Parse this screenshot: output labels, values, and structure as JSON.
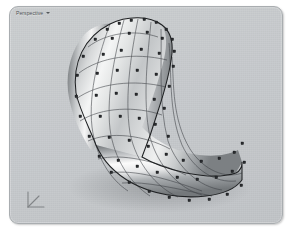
{
  "window": {
    "background_color": "#ffffff"
  },
  "viewport": {
    "label": "Perspective",
    "caret_icon": "chevron-down-icon",
    "background_color": "#c5c8cb",
    "border_color": "#a9adb0",
    "corner_radius_px": 9
  },
  "axis_gizmo": {
    "icon": "axis-gizmo-icon",
    "axes": [
      "x",
      "y",
      "z"
    ]
  },
  "model": {
    "type": "nurbs-surface",
    "display_mode": "shaded",
    "name": "curved-freeform-surface",
    "surface_color_light": "#f2f3f3",
    "surface_color_mid": "#b9bcbf",
    "surface_color_dark": "#6f7376",
    "isocurve_color": "#3c4043",
    "edge_color": "#1c1e20",
    "control_point_color": "#2b2d30",
    "control_point_count": 62,
    "isocurve_u_count": 9,
    "isocurve_v_count": 8,
    "selected": true
  }
}
